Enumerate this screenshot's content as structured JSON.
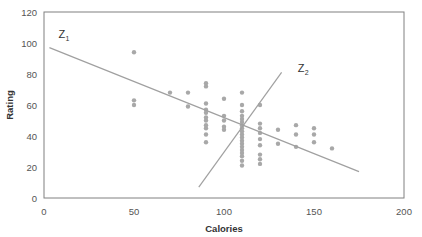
{
  "chart_data": {
    "type": "scatter",
    "title": "",
    "xlabel": "Calories",
    "ylabel": "Rating",
    "xlim": [
      0,
      200
    ],
    "ylim": [
      0,
      120
    ],
    "xticks": [
      0,
      50,
      100,
      150,
      200
    ],
    "yticks": [
      0,
      20,
      40,
      60,
      80,
      100,
      120
    ],
    "grid": false,
    "legend": "none",
    "point_color": "#a8a8a8",
    "line_color": "#a0a0a0",
    "axis_color": "#808080",
    "points": [
      {
        "x": 50,
        "y": 94
      },
      {
        "x": 50,
        "y": 63
      },
      {
        "x": 50,
        "y": 60
      },
      {
        "x": 70,
        "y": 68
      },
      {
        "x": 80,
        "y": 68
      },
      {
        "x": 80,
        "y": 59
      },
      {
        "x": 90,
        "y": 74
      },
      {
        "x": 90,
        "y": 72
      },
      {
        "x": 90,
        "y": 61
      },
      {
        "x": 90,
        "y": 57
      },
      {
        "x": 90,
        "y": 55
      },
      {
        "x": 90,
        "y": 52
      },
      {
        "x": 90,
        "y": 50
      },
      {
        "x": 90,
        "y": 47
      },
      {
        "x": 90,
        "y": 45
      },
      {
        "x": 90,
        "y": 41
      },
      {
        "x": 90,
        "y": 36
      },
      {
        "x": 100,
        "y": 64
      },
      {
        "x": 100,
        "y": 53
      },
      {
        "x": 100,
        "y": 50
      },
      {
        "x": 100,
        "y": 46
      },
      {
        "x": 100,
        "y": 44
      },
      {
        "x": 110,
        "y": 68
      },
      {
        "x": 110,
        "y": 60
      },
      {
        "x": 110,
        "y": 56
      },
      {
        "x": 110,
        "y": 53
      },
      {
        "x": 110,
        "y": 51
      },
      {
        "x": 110,
        "y": 49
      },
      {
        "x": 110,
        "y": 47
      },
      {
        "x": 110,
        "y": 45
      },
      {
        "x": 110,
        "y": 43
      },
      {
        "x": 110,
        "y": 41
      },
      {
        "x": 110,
        "y": 39
      },
      {
        "x": 110,
        "y": 37
      },
      {
        "x": 110,
        "y": 35
      },
      {
        "x": 110,
        "y": 33
      },
      {
        "x": 110,
        "y": 31
      },
      {
        "x": 110,
        "y": 29
      },
      {
        "x": 110,
        "y": 27
      },
      {
        "x": 110,
        "y": 24
      },
      {
        "x": 110,
        "y": 21
      },
      {
        "x": 120,
        "y": 60
      },
      {
        "x": 120,
        "y": 48
      },
      {
        "x": 120,
        "y": 45
      },
      {
        "x": 120,
        "y": 42
      },
      {
        "x": 120,
        "y": 38
      },
      {
        "x": 120,
        "y": 34
      },
      {
        "x": 120,
        "y": 28
      },
      {
        "x": 120,
        "y": 25
      },
      {
        "x": 120,
        "y": 22
      },
      {
        "x": 130,
        "y": 44
      },
      {
        "x": 130,
        "y": 35
      },
      {
        "x": 140,
        "y": 47
      },
      {
        "x": 140,
        "y": 41
      },
      {
        "x": 140,
        "y": 33
      },
      {
        "x": 150,
        "y": 45
      },
      {
        "x": 150,
        "y": 41
      },
      {
        "x": 150,
        "y": 36
      },
      {
        "x": 160,
        "y": 32
      }
    ],
    "lines": [
      {
        "name": "Z1",
        "label": "Z",
        "subscript": "1",
        "x0": 3,
        "y0": 97,
        "x1": 175,
        "y1": 17,
        "label_x": 8,
        "label_y": 103
      },
      {
        "name": "Z2",
        "label": "Z",
        "subscript": "2",
        "x0": 86,
        "y0": 7,
        "x1": 132,
        "y1": 81,
        "label_x": 141,
        "label_y": 81
      }
    ]
  }
}
